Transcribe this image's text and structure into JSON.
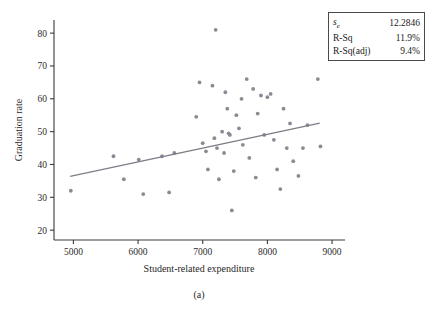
{
  "figure": {
    "caption": "(a)"
  },
  "stats_box": {
    "rows": [
      {
        "label_main": "s",
        "label_sub": "e",
        "value": "12.2846"
      },
      {
        "label_main": "R-Sq",
        "label_sub": "",
        "value": "11.9%"
      },
      {
        "label_main": "R-Sq(adj)",
        "label_sub": "",
        "value": "9.4%"
      }
    ]
  },
  "chart_data": {
    "type": "scatter",
    "title": "",
    "xlabel": "Student-related expenditure",
    "ylabel": "Graduation rate",
    "xlim": [
      4700,
      9200
    ],
    "ylim": [
      17,
      84
    ],
    "xticks": [
      5000,
      6000,
      7000,
      8000,
      9000
    ],
    "yticks": [
      20,
      30,
      40,
      50,
      60,
      70,
      80
    ],
    "xtick_labels": [
      "5000",
      "6000",
      "7000",
      "8000",
      "9000"
    ],
    "ytick_labels": [
      "20",
      "30",
      "40",
      "50",
      "60",
      "70",
      "80"
    ],
    "grid": false,
    "legend": "none",
    "marker_color": "#8a8a95",
    "line_color": "#7c7c86",
    "points": [
      [
        4960,
        32.0
      ],
      [
        5620,
        42.5
      ],
      [
        5780,
        35.5
      ],
      [
        6010,
        41.5
      ],
      [
        6080,
        31.0
      ],
      [
        6370,
        42.5
      ],
      [
        6480,
        31.5
      ],
      [
        6560,
        43.5
      ],
      [
        6900,
        54.5
      ],
      [
        6950,
        65.0
      ],
      [
        7000,
        46.5
      ],
      [
        7050,
        44.0
      ],
      [
        7080,
        38.5
      ],
      [
        7150,
        64.0
      ],
      [
        7180,
        48.0
      ],
      [
        7200,
        81.0
      ],
      [
        7220,
        45.0
      ],
      [
        7250,
        35.5
      ],
      [
        7300,
        50.0
      ],
      [
        7330,
        43.5
      ],
      [
        7350,
        62.0
      ],
      [
        7380,
        57.0
      ],
      [
        7400,
        49.5
      ],
      [
        7420,
        49.0
      ],
      [
        7450,
        26.0
      ],
      [
        7480,
        38.0
      ],
      [
        7520,
        55.0
      ],
      [
        7560,
        51.0
      ],
      [
        7600,
        60.0
      ],
      [
        7620,
        46.0
      ],
      [
        7680,
        66.0
      ],
      [
        7720,
        42.0
      ],
      [
        7780,
        63.0
      ],
      [
        7820,
        36.0
      ],
      [
        7850,
        55.5
      ],
      [
        7900,
        61.0
      ],
      [
        7950,
        49.0
      ],
      [
        8000,
        60.5
      ],
      [
        8050,
        61.5
      ],
      [
        8100,
        47.5
      ],
      [
        8150,
        38.5
      ],
      [
        8200,
        32.5
      ],
      [
        8250,
        57.0
      ],
      [
        8300,
        45.0
      ],
      [
        8350,
        52.5
      ],
      [
        8400,
        41.0
      ],
      [
        8480,
        36.5
      ],
      [
        8550,
        45.0
      ],
      [
        8620,
        52.0
      ],
      [
        8780,
        66.0
      ],
      [
        8820,
        45.5
      ]
    ],
    "fit_line": {
      "x_start": 4950,
      "y_start": 36.4,
      "x_end": 8810,
      "y_end": 52.6
    }
  }
}
